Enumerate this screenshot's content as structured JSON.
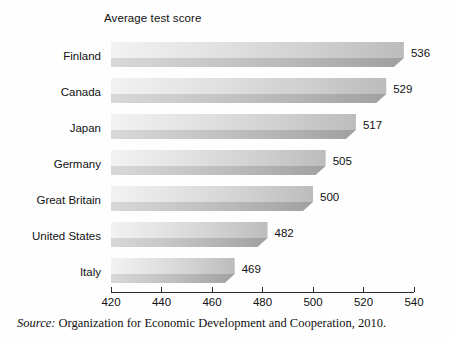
{
  "chart_data": {
    "type": "bar",
    "orientation": "horizontal",
    "title": "Average test score",
    "xlabel": "",
    "ylabel": "",
    "categories": [
      "Finland",
      "Canada",
      "Japan",
      "Germany",
      "Great Britain",
      "United States",
      "Italy"
    ],
    "values": [
      536,
      529,
      517,
      505,
      500,
      482,
      469
    ],
    "value_labels": [
      "536",
      "529",
      "517",
      "505",
      "500",
      "482",
      "469"
    ],
    "xlim": [
      420,
      540
    ],
    "xticks": [
      420,
      440,
      460,
      480,
      500,
      520,
      540
    ],
    "xtick_labels": [
      "420",
      "440",
      "460",
      "480",
      "500",
      "520",
      "540"
    ],
    "grid": false,
    "legend": null,
    "style": "3d-extruded-grayscale-bars"
  },
  "source": {
    "prefix": "Source:",
    "text": "Organization for Economic Development and Cooperation, 2010."
  },
  "colors": {
    "bar_light": "#ececed",
    "bar_mid": "#c9c9ca",
    "bar_dark": "#a8a8a9",
    "bar_shadow": "#9a9a9b",
    "axis": "#2b2b2b",
    "text": "#111111",
    "background": "#fefefe"
  }
}
